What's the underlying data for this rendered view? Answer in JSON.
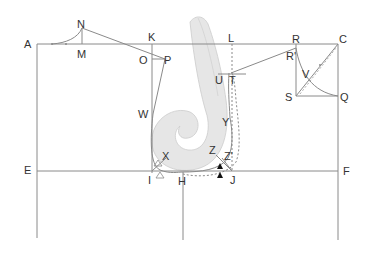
{
  "diagram": {
    "title": "",
    "points": [
      {
        "id": "A",
        "x": 24,
        "y": 39
      },
      {
        "id": "N",
        "x": 78,
        "y": 20
      },
      {
        "id": "M",
        "x": 78,
        "y": 49
      },
      {
        "id": "K",
        "x": 148,
        "y": 32
      },
      {
        "id": "O",
        "x": 139,
        "y": 56
      },
      {
        "id": "P",
        "x": 163,
        "y": 56
      },
      {
        "id": "W",
        "x": 138,
        "y": 110
      },
      {
        "id": "L",
        "x": 228,
        "y": 35
      },
      {
        "id": "R",
        "x": 292,
        "y": 35
      },
      {
        "id": "R'",
        "x": 285,
        "y": 52
      },
      {
        "id": "C",
        "x": 338,
        "y": 35
      },
      {
        "id": "U",
        "x": 214,
        "y": 75
      },
      {
        "id": "T",
        "x": 229,
        "y": 75
      },
      {
        "id": "V",
        "x": 302,
        "y": 70
      },
      {
        "id": "S",
        "x": 285,
        "y": 92
      },
      {
        "id": "Q",
        "x": 339,
        "y": 92
      },
      {
        "id": "Y",
        "x": 222,
        "y": 118
      },
      {
        "id": "X",
        "x": 162,
        "y": 152
      },
      {
        "id": "Z",
        "x": 210,
        "y": 146
      },
      {
        "id": "Z'",
        "x": 224,
        "y": 152
      },
      {
        "id": "E",
        "x": 22,
        "y": 165
      },
      {
        "id": "I",
        "x": 146,
        "y": 175
      },
      {
        "id": "H",
        "x": 178,
        "y": 177
      },
      {
        "id": "J",
        "x": 230,
        "y": 175
      },
      {
        "id": "F",
        "x": 342,
        "y": 166
      }
    ],
    "colors": {
      "line": "#8a8a8a",
      "ruler_fill": "#e4e4e4",
      "ruler_stroke": "#c8c8c8",
      "text": "#333333",
      "marker": "#111111"
    }
  }
}
